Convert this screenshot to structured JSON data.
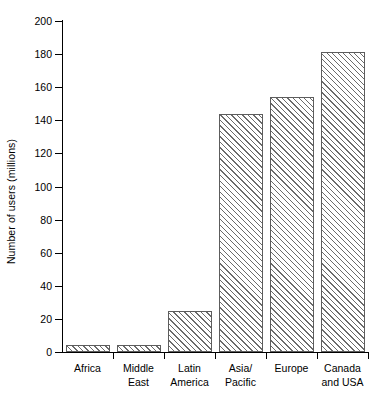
{
  "chart_data": {
    "type": "bar",
    "title": "",
    "xlabel": "",
    "ylabel": "Number of users (millions)",
    "categories": [
      "Africa",
      "Middle East",
      "Latin America",
      "Asia/ Pacific",
      "Europe",
      "Canada and USA"
    ],
    "category_lines": [
      [
        "Africa"
      ],
      [
        "Middle",
        "East"
      ],
      [
        "Latin",
        "America"
      ],
      [
        "Asia/",
        "Pacific"
      ],
      [
        "Europe"
      ],
      [
        "Canada",
        "and USA"
      ]
    ],
    "values": [
      4,
      4,
      25,
      144,
      154,
      181
    ],
    "ylim": [
      0,
      200
    ],
    "ytick_step": 20,
    "yticks": [
      0,
      20,
      40,
      60,
      80,
      100,
      120,
      140,
      160,
      180,
      200
    ],
    "ytick_labels": [
      "0",
      "20",
      "40",
      "60",
      "80",
      "100",
      "120",
      "140",
      "160",
      "180",
      "200"
    ],
    "grid": false,
    "legend": false,
    "bar_fill": "diagonal-hatch",
    "bar_edge_color": "#5d5d5d",
    "hatch_color": "#6b6b6b",
    "background_color": "#ffffff",
    "axis_color": "#000000"
  }
}
